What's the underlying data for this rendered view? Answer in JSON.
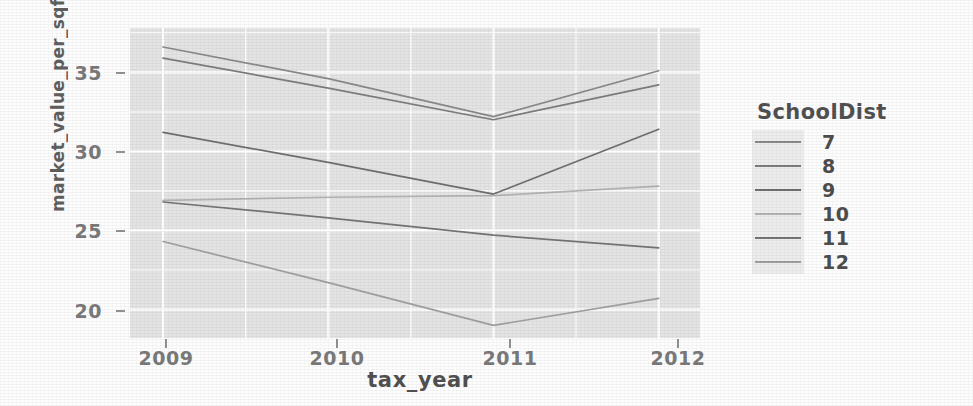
{
  "chart_data": {
    "type": "line",
    "title": "",
    "xlabel": "tax_year",
    "ylabel": "market_value_per_sqft",
    "legend_title": "SchoolDist",
    "legend_position": "right",
    "grid": true,
    "x": [
      2009,
      2010,
      2011,
      2012
    ],
    "xticklabels": [
      "2009",
      "2010",
      "2011",
      "2012"
    ],
    "yticklabels": [
      "20",
      "25",
      "30",
      "35"
    ],
    "yticks": [
      20,
      25,
      30,
      35
    ],
    "xlim": [
      2008.8,
      2012.25
    ],
    "ylim": [
      18.2,
      37.8
    ],
    "series": [
      {
        "name": "7",
        "color": "#8a8a8a",
        "values": [
          36.6,
          34.6,
          32.2,
          35.1
        ]
      },
      {
        "name": "8",
        "color": "#7d7d7d",
        "values": [
          35.9,
          34.0,
          32.0,
          34.2
        ]
      },
      {
        "name": "9",
        "color": "#6f6f6f",
        "values": [
          31.2,
          29.3,
          27.3,
          31.4
        ]
      },
      {
        "name": "10",
        "color": "#b3b3b3",
        "values": [
          26.9,
          27.1,
          27.2,
          27.8
        ]
      },
      {
        "name": "11",
        "color": "#757575",
        "values": [
          26.8,
          25.8,
          24.7,
          23.9
        ]
      },
      {
        "name": "12",
        "color": "#a0a0a0",
        "values": [
          24.3,
          21.7,
          19.0,
          20.7
        ]
      }
    ]
  },
  "axis": {
    "y_title": "market_value_per_sqft",
    "x_title": "tax_year",
    "y_ticks": [
      "35",
      "30",
      "25",
      "20"
    ],
    "x_ticks": [
      "2009",
      "2010",
      "2011",
      "2012"
    ]
  },
  "legend": {
    "title": "SchoolDist",
    "items": [
      {
        "label": "7"
      },
      {
        "label": "8"
      },
      {
        "label": "9"
      },
      {
        "label": "10"
      },
      {
        "label": "11"
      },
      {
        "label": "12"
      }
    ]
  },
  "colors": {
    "panel_background": "#e2e2e2",
    "grid_color": "#ffffff",
    "text_color": "#3f3f3f"
  }
}
